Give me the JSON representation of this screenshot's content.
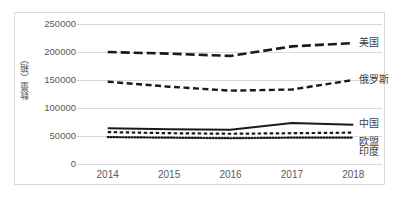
{
  "chart_data": {
    "type": "line",
    "title": "",
    "xlabel": "",
    "ylabel": "数量（箱）",
    "categories": [
      "2014",
      "2015",
      "2016",
      "2017",
      "2018"
    ],
    "ylim": [
      0,
      250000
    ],
    "ytick_step": 50000,
    "yticks": [
      "0",
      "50000",
      "100000",
      "150000",
      "200000",
      "250000"
    ],
    "grid": true,
    "legend_position": "line-end-right",
    "series": [
      {
        "name": "美国",
        "style": "long-dash",
        "color": "#1a1a1a",
        "values": [
          200000,
          197000,
          193000,
          210000,
          216000
        ]
      },
      {
        "name": "俄罗斯",
        "style": "medium-dash",
        "color": "#1a1a1a",
        "values": [
          147000,
          138000,
          131000,
          133000,
          150000
        ]
      },
      {
        "name": "中国",
        "style": "solid",
        "color": "#1a1a1a",
        "values": [
          64000,
          62000,
          61000,
          73000,
          70000
        ]
      },
      {
        "name": "欧盟",
        "style": "short-dash",
        "color": "#1a1a1a",
        "values": [
          57000,
          55000,
          54000,
          55000,
          56000
        ]
      },
      {
        "name": "印度",
        "style": "dotted",
        "color": "#1a1a1a",
        "values": [
          48000,
          47000,
          46000,
          47000,
          47000
        ]
      }
    ]
  }
}
